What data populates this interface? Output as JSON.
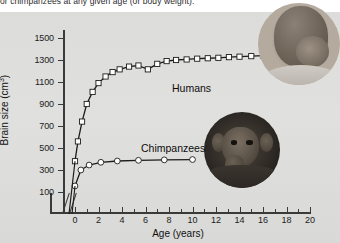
{
  "caption": {
    "cut_off_line": "or chimpanzees at any given age (or body weight)."
  },
  "chart_data": {
    "type": "line",
    "title": "",
    "xlabel": "Age (years)",
    "ylabel": "Brain size (cm",
    "ylabel_sup": "3",
    "ylabel_suffix": ")",
    "xlim": [
      0,
      20
    ],
    "ylim": [
      0,
      1600
    ],
    "xticks": [
      0,
      2,
      4,
      6,
      8,
      10,
      12,
      14,
      16,
      18,
      20
    ],
    "xtick_labels": [
      "0",
      "2",
      "4",
      "6",
      "8",
      "10",
      "12",
      "14",
      "16",
      "18",
      "20"
    ],
    "yticks": [
      100,
      300,
      500,
      700,
      900,
      1100,
      1300,
      1500
    ],
    "ytick_labels": [
      "100",
      "300",
      "500",
      "700",
      "900",
      "1100",
      "1300",
      "1500"
    ],
    "grid": false,
    "legend_position": "inline-annotation",
    "axis_break": "x-axis break before 0",
    "series": [
      {
        "name": "Humans",
        "marker": "open-square",
        "label": "Humans",
        "x": [
          0,
          0.25,
          0.6,
          1.0,
          1.5,
          2.0,
          2.6,
          3.2,
          3.8,
          4.6,
          5.4,
          6.2,
          7.0,
          7.8,
          8.6,
          9.5,
          10.4,
          11.3,
          12.2,
          13.1,
          14.0,
          15.0,
          16.0,
          17.0,
          18.0,
          19.0,
          20.0
        ],
        "y": [
          380,
          560,
          740,
          900,
          1010,
          1090,
          1150,
          1190,
          1215,
          1240,
          1250,
          1215,
          1265,
          1290,
          1300,
          1305,
          1312,
          1316,
          1320,
          1326,
          1330,
          1335,
          1340,
          1345,
          1350,
          1355,
          1360
        ]
      },
      {
        "name": "Chimpanzees",
        "marker": "open-circle",
        "label": "Chimpanzees",
        "x": [
          0,
          0.5,
          1.2,
          2.2,
          3.6,
          5.4,
          7.6,
          10.0
        ],
        "y": [
          155,
          300,
          345,
          370,
          382,
          388,
          392,
          395
        ]
      }
    ]
  },
  "annotations": {
    "humans_label": "Humans",
    "chimpanzees_label": "Chimpanzees"
  },
  "photos": {
    "baby": "human-baby-photo",
    "chimp": "chimpanzee-photo"
  },
  "colors": {
    "panel_background": "#dedede",
    "axis": "#3a3a3a",
    "curve": "#1c1c1c",
    "marker_fill": "#ffffff",
    "text": "#111111"
  }
}
